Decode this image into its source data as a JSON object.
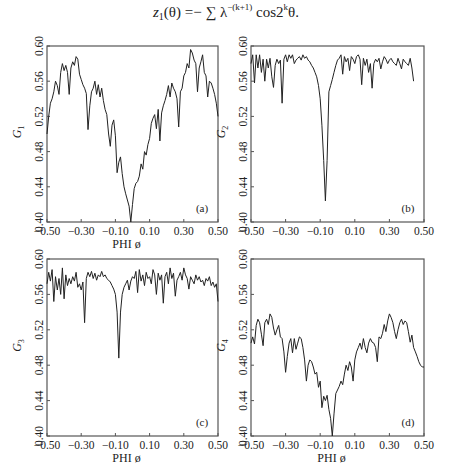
{
  "formula": {
    "lhs": "z",
    "lhs_sub": "1",
    "arg": "(θ) =− ∑ λ",
    "exp": "−(k+1)",
    "rhs": " cos2",
    "rhs_exp": "k",
    "tail": "θ."
  },
  "chart_data": [
    {
      "type": "line",
      "panel": "(a)",
      "title": "",
      "xlabel": "PHI   ø",
      "ylabel": "G1",
      "ylabel_main": "G",
      "ylabel_sub": "1",
      "xlim": [
        -0.5,
        0.5
      ],
      "ylim": [
        0.4,
        0.6
      ],
      "xticks": [
        "-0.50",
        "-0.30",
        "-0.10",
        "0.10",
        "0.30",
        "0.50"
      ],
      "yticks": [
        "0.40",
        "0.44",
        "0.48",
        "0.52",
        "0.56",
        "0.60"
      ],
      "show_xlabel": true,
      "x": [
        -0.5,
        -0.49,
        -0.48,
        -0.47,
        -0.46,
        -0.45,
        -0.44,
        -0.43,
        -0.42,
        -0.41,
        -0.4,
        -0.39,
        -0.38,
        -0.37,
        -0.36,
        -0.35,
        -0.34,
        -0.33,
        -0.32,
        -0.31,
        -0.3,
        -0.29,
        -0.28,
        -0.27,
        -0.26,
        -0.25,
        -0.24,
        -0.23,
        -0.22,
        -0.21,
        -0.2,
        -0.19,
        -0.18,
        -0.17,
        -0.16,
        -0.15,
        -0.14,
        -0.13,
        -0.12,
        -0.11,
        -0.1,
        -0.09,
        -0.08,
        -0.07,
        -0.06,
        -0.05,
        -0.04,
        -0.03,
        -0.02,
        -0.01,
        0.0,
        0.01,
        0.02,
        0.03,
        0.04,
        0.05,
        0.06,
        0.07,
        0.08,
        0.09,
        0.1,
        0.11,
        0.12,
        0.13,
        0.14,
        0.15,
        0.16,
        0.17,
        0.18,
        0.19,
        0.2,
        0.21,
        0.22,
        0.23,
        0.24,
        0.25,
        0.26,
        0.27,
        0.28,
        0.29,
        0.3,
        0.31,
        0.32,
        0.33,
        0.34,
        0.35,
        0.36,
        0.37,
        0.38,
        0.39,
        0.4,
        0.41,
        0.42,
        0.43,
        0.44,
        0.45,
        0.46,
        0.47,
        0.48,
        0.49,
        0.5
      ],
      "values": [
        0.5,
        0.52,
        0.535,
        0.54,
        0.548,
        0.56,
        0.555,
        0.545,
        0.57,
        0.58,
        0.572,
        0.578,
        0.57,
        0.545,
        0.575,
        0.582,
        0.578,
        0.588,
        0.585,
        0.568,
        0.562,
        0.556,
        0.552,
        0.546,
        0.505,
        0.532,
        0.548,
        0.552,
        0.56,
        0.545,
        0.556,
        0.542,
        0.552,
        0.538,
        0.528,
        0.522,
        0.5,
        0.486,
        0.51,
        0.516,
        0.498,
        0.456,
        0.468,
        0.474,
        0.455,
        0.44,
        0.432,
        0.425,
        0.418,
        0.4,
        0.42,
        0.438,
        0.444,
        0.446,
        0.452,
        0.466,
        0.46,
        0.48,
        0.476,
        0.488,
        0.495,
        0.512,
        0.518,
        0.522,
        0.506,
        0.528,
        0.492,
        0.524,
        0.532,
        0.538,
        0.545,
        0.555,
        0.542,
        0.558,
        0.552,
        0.548,
        0.54,
        0.508,
        0.548,
        0.552,
        0.566,
        0.57,
        0.58,
        0.575,
        0.596,
        0.592,
        0.584,
        0.58,
        0.548,
        0.575,
        0.582,
        0.59,
        0.57,
        0.566,
        0.542,
        0.56,
        0.558,
        0.552,
        0.545,
        0.535,
        0.52
      ]
    },
    {
      "type": "line",
      "panel": "(b)",
      "title": "",
      "xlabel": "",
      "ylabel": "G2",
      "ylabel_main": "G",
      "ylabel_sub": "2",
      "xlim": [
        -0.5,
        0.5
      ],
      "ylim": [
        0.4,
        0.6
      ],
      "xticks": [
        "-0.50",
        "-0.30",
        "-0.10",
        "0.10",
        "0.30",
        "0.50"
      ],
      "yticks": [
        "0.40",
        "0.44",
        "0.48",
        "0.52",
        "0.56",
        "0.60"
      ],
      "show_xlabel": false,
      "x": [
        -0.5,
        -0.49,
        -0.48,
        -0.47,
        -0.46,
        -0.45,
        -0.44,
        -0.43,
        -0.42,
        -0.41,
        -0.4,
        -0.39,
        -0.38,
        -0.37,
        -0.36,
        -0.35,
        -0.34,
        -0.33,
        -0.32,
        -0.31,
        -0.3,
        -0.29,
        -0.28,
        -0.27,
        -0.26,
        -0.25,
        -0.24,
        -0.23,
        -0.22,
        -0.21,
        -0.2,
        -0.19,
        -0.18,
        -0.17,
        -0.16,
        -0.15,
        -0.14,
        -0.13,
        -0.12,
        -0.11,
        -0.1,
        -0.09,
        -0.08,
        -0.07,
        -0.06,
        -0.05,
        -0.04,
        -0.03,
        -0.02,
        -0.01,
        0.0,
        0.01,
        0.02,
        0.03,
        0.04,
        0.05,
        0.06,
        0.07,
        0.08,
        0.09,
        0.1,
        0.11,
        0.12,
        0.13,
        0.14,
        0.15,
        0.16,
        0.17,
        0.18,
        0.19,
        0.2,
        0.21,
        0.22,
        0.23,
        0.24,
        0.25,
        0.26,
        0.27,
        0.28,
        0.29,
        0.3,
        0.31,
        0.32,
        0.33,
        0.34,
        0.35,
        0.36,
        0.37,
        0.38,
        0.39,
        0.4,
        0.41,
        0.42,
        0.43,
        0.44,
        0.45,
        0.46,
        0.47,
        0.48,
        0.49,
        0.5
      ],
      "values": [
        0.58,
        0.59,
        0.558,
        0.59,
        0.575,
        0.59,
        0.57,
        0.585,
        0.56,
        0.585,
        0.575,
        0.586,
        0.565,
        0.553,
        0.578,
        0.585,
        0.58,
        0.584,
        0.535,
        0.585,
        0.59,
        0.582,
        0.59,
        0.586,
        0.59,
        0.58,
        0.584,
        0.586,
        0.588,
        0.584,
        0.59,
        0.586,
        0.588,
        0.584,
        0.582,
        0.578,
        0.575,
        0.57,
        0.565,
        0.555,
        0.54,
        0.51,
        0.47,
        0.424,
        0.47,
        0.548,
        0.555,
        0.562,
        0.57,
        0.578,
        0.584,
        0.586,
        0.59,
        0.568,
        0.588,
        0.582,
        0.586,
        0.572,
        0.588,
        0.585,
        0.58,
        0.588,
        0.59,
        0.585,
        0.556,
        0.586,
        0.578,
        0.585,
        0.57,
        0.58,
        0.552,
        0.58,
        0.585,
        0.582,
        0.586,
        0.574,
        0.582,
        0.588,
        0.585,
        0.58,
        0.584,
        0.586,
        0.582,
        0.58,
        0.578,
        0.586,
        0.58,
        0.574,
        0.585,
        0.582,
        0.58,
        0.578,
        0.586,
        0.575,
        0.56
      ],
      "values_note": "sharp dip to ~0.424 near x=-0.05"
    },
    {
      "type": "line",
      "panel": "(c)",
      "title": "",
      "xlabel": "PHI   ø",
      "ylabel": "G3",
      "ylabel_main": "G",
      "ylabel_sub": "3",
      "xlim": [
        -0.5,
        0.5
      ],
      "ylim": [
        0.4,
        0.6
      ],
      "xticks": [
        "-0.50",
        "-0.30",
        "-0.10",
        "0.10",
        "0.30",
        "0.50"
      ],
      "yticks": [
        "0.40",
        "0.44",
        "0.48",
        "0.52",
        "0.56",
        "0.60"
      ],
      "show_xlabel": true,
      "x": [
        -0.5,
        -0.49,
        -0.48,
        -0.47,
        -0.46,
        -0.45,
        -0.44,
        -0.43,
        -0.42,
        -0.41,
        -0.4,
        -0.39,
        -0.38,
        -0.37,
        -0.36,
        -0.35,
        -0.34,
        -0.33,
        -0.32,
        -0.31,
        -0.3,
        -0.29,
        -0.28,
        -0.27,
        -0.26,
        -0.25,
        -0.24,
        -0.23,
        -0.22,
        -0.21,
        -0.2,
        -0.19,
        -0.18,
        -0.17,
        -0.16,
        -0.15,
        -0.14,
        -0.13,
        -0.12,
        -0.11,
        -0.1,
        -0.09,
        -0.08,
        -0.07,
        -0.06,
        -0.05,
        -0.04,
        -0.03,
        -0.02,
        -0.01,
        0.0,
        0.01,
        0.02,
        0.03,
        0.04,
        0.05,
        0.06,
        0.07,
        0.08,
        0.09,
        0.1,
        0.11,
        0.12,
        0.13,
        0.14,
        0.15,
        0.16,
        0.17,
        0.18,
        0.19,
        0.2,
        0.21,
        0.22,
        0.23,
        0.24,
        0.25,
        0.26,
        0.27,
        0.28,
        0.29,
        0.3,
        0.31,
        0.32,
        0.33,
        0.34,
        0.35,
        0.36,
        0.37,
        0.38,
        0.39,
        0.4,
        0.41,
        0.42,
        0.43,
        0.44,
        0.45,
        0.46,
        0.47,
        0.48,
        0.49,
        0.5
      ],
      "values": [
        0.572,
        0.585,
        0.575,
        0.588,
        0.552,
        0.58,
        0.565,
        0.578,
        0.56,
        0.59,
        0.555,
        0.582,
        0.57,
        0.578,
        0.572,
        0.58,
        0.575,
        0.585,
        0.568,
        0.572,
        0.565,
        0.574,
        0.528,
        0.578,
        0.585,
        0.58,
        0.586,
        0.578,
        0.584,
        0.576,
        0.582,
        0.58,
        0.586,
        0.58,
        0.582,
        0.578,
        0.576,
        0.574,
        0.57,
        0.566,
        0.56,
        0.54,
        0.488,
        0.54,
        0.56,
        0.568,
        0.572,
        0.576,
        0.565,
        0.575,
        0.58,
        0.578,
        0.586,
        0.562,
        0.588,
        0.575,
        0.582,
        0.57,
        0.585,
        0.578,
        0.58,
        0.572,
        0.588,
        0.582,
        0.56,
        0.584,
        0.576,
        0.582,
        0.55,
        0.58,
        0.585,
        0.572,
        0.59,
        0.578,
        0.584,
        0.558,
        0.576,
        0.58,
        0.585,
        0.576,
        0.59,
        0.582,
        0.578,
        0.566,
        0.58,
        0.576,
        0.572,
        0.582,
        0.576,
        0.58,
        0.574,
        0.576,
        0.57,
        0.578,
        0.575,
        0.58,
        0.57,
        0.574,
        0.568,
        0.572,
        0.552
      ],
      "values_note": "sharp dip to ~0.488 near x=-0.07; secondary dip ~0.528 near x=-0.28"
    },
    {
      "type": "line",
      "panel": "(d)",
      "title": "",
      "xlabel": "PHI   ø",
      "ylabel": "G4",
      "ylabel_main": "G",
      "ylabel_sub": "4",
      "xlim": [
        -0.5,
        0.5
      ],
      "ylim": [
        0.4,
        0.6
      ],
      "xticks": [
        "-0.50",
        "-0.30",
        "-0.10",
        "0.10",
        "0.30",
        "0.50"
      ],
      "yticks": [
        "0.40",
        "0.44",
        "0.48",
        "0.52",
        "0.56",
        "0.60"
      ],
      "show_xlabel": true,
      "x": [
        -0.5,
        -0.49,
        -0.48,
        -0.47,
        -0.46,
        -0.45,
        -0.44,
        -0.43,
        -0.42,
        -0.41,
        -0.4,
        -0.39,
        -0.38,
        -0.37,
        -0.36,
        -0.35,
        -0.34,
        -0.33,
        -0.32,
        -0.31,
        -0.3,
        -0.29,
        -0.28,
        -0.27,
        -0.26,
        -0.25,
        -0.24,
        -0.23,
        -0.22,
        -0.21,
        -0.2,
        -0.19,
        -0.18,
        -0.17,
        -0.16,
        -0.15,
        -0.14,
        -0.13,
        -0.12,
        -0.11,
        -0.1,
        -0.09,
        -0.08,
        -0.07,
        -0.06,
        -0.05,
        -0.04,
        -0.03,
        -0.02,
        -0.01,
        0.0,
        0.01,
        0.02,
        0.03,
        0.04,
        0.05,
        0.06,
        0.07,
        0.08,
        0.09,
        0.1,
        0.11,
        0.12,
        0.13,
        0.14,
        0.15,
        0.16,
        0.17,
        0.18,
        0.19,
        0.2,
        0.21,
        0.22,
        0.23,
        0.24,
        0.25,
        0.26,
        0.27,
        0.28,
        0.29,
        0.3,
        0.31,
        0.32,
        0.33,
        0.34,
        0.35,
        0.36,
        0.37,
        0.38,
        0.39,
        0.4,
        0.41,
        0.42,
        0.43,
        0.44,
        0.45,
        0.46,
        0.47,
        0.48,
        0.49,
        0.5
      ],
      "values": [
        0.505,
        0.512,
        0.504,
        0.525,
        0.532,
        0.528,
        0.515,
        0.502,
        0.528,
        0.532,
        0.526,
        0.538,
        0.534,
        0.522,
        0.514,
        0.52,
        0.525,
        0.512,
        0.51,
        0.495,
        0.472,
        0.49,
        0.505,
        0.51,
        0.494,
        0.51,
        0.498,
        0.505,
        0.512,
        0.51,
        0.5,
        0.486,
        0.462,
        0.48,
        0.486,
        0.484,
        0.478,
        0.47,
        0.472,
        0.455,
        0.462,
        0.432,
        0.445,
        0.44,
        0.446,
        0.43,
        0.42,
        0.4,
        0.425,
        0.448,
        0.452,
        0.456,
        0.462,
        0.458,
        0.47,
        0.48,
        0.474,
        0.484,
        0.478,
        0.462,
        0.486,
        0.495,
        0.5,
        0.505,
        0.498,
        0.51,
        0.5,
        0.494,
        0.505,
        0.51,
        0.506,
        0.505,
        0.5,
        0.484,
        0.512,
        0.51,
        0.516,
        0.526,
        0.518,
        0.53,
        0.538,
        0.534,
        0.528,
        0.518,
        0.51,
        0.52,
        0.528,
        0.532,
        0.526,
        0.53,
        0.528,
        0.518,
        0.506,
        0.514,
        0.5,
        0.495,
        0.49,
        0.484,
        0.48,
        0.478,
        0.478
      ],
      "values_note": "minimum ~0.400 near x=-0.03"
    }
  ]
}
